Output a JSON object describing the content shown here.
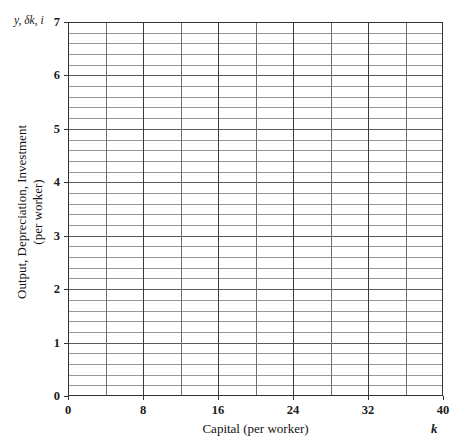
{
  "chart_data": {
    "type": "line",
    "title": "",
    "subtitle": "",
    "xlabel": "Capital (per worker)",
    "ylabel": "Output, Depreciation, Investment (per worker)",
    "x_symbol": "k",
    "y_symbol": "y, δk, i",
    "xlim": [
      0,
      40
    ],
    "ylim": [
      0,
      7
    ],
    "x_ticks": [
      0,
      8,
      16,
      24,
      32,
      40
    ],
    "x_tick_labels": [
      "0",
      "8",
      "16",
      "24",
      "32",
      "40"
    ],
    "x_minor_step": 4,
    "y_ticks": [
      0,
      1,
      2,
      3,
      4,
      5,
      6,
      7
    ],
    "y_tick_labels": [
      "0",
      "1",
      "2",
      "3",
      "4",
      "5",
      "6",
      "7"
    ],
    "y_minor_step": 0.2,
    "grid": true,
    "grid_color": "#808080",
    "axis_color": "#333333",
    "background": "#ffffff",
    "legend": null,
    "legend_position": "none",
    "series": [],
    "annotations": [],
    "note": "Empty plotting grid template; no data series are drawn."
  },
  "axes": {
    "y_symbol_label": "y, δk, i",
    "x_symbol_label": "k",
    "y_title_line1": "Output, Depreciation, Investment",
    "y_title_line2": "(per worker)",
    "x_title": "Capital (per worker)"
  }
}
